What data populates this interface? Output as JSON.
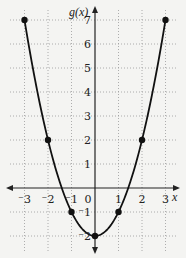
{
  "chart_data": {
    "type": "line",
    "title": "",
    "xlabel": "x",
    "ylabel": "g(x)",
    "xlim": [
      -3.5,
      3.5
    ],
    "ylim": [
      -2.5,
      7.5
    ],
    "grid": true,
    "grid_style": "dotted",
    "x_ticks": [
      -3,
      -2,
      -1,
      0,
      1,
      2,
      3
    ],
    "x_tick_labels": [
      "⁻3",
      "⁻2",
      "⁻1",
      "0",
      "1",
      "2",
      "3"
    ],
    "y_ticks": [
      -2,
      -1,
      1,
      2,
      3,
      4,
      5,
      6,
      7
    ],
    "y_tick_labels": [
      "⁻2",
      "⁻1",
      "1",
      "2",
      "3",
      "4",
      "5",
      "6",
      "7"
    ],
    "series": [
      {
        "name": "g(x)",
        "points": [
          {
            "x": -3,
            "y": 7
          },
          {
            "x": -2,
            "y": 2
          },
          {
            "x": -1,
            "y": -1
          },
          {
            "x": 0,
            "y": -2
          },
          {
            "x": 1,
            "y": -1
          },
          {
            "x": 2,
            "y": 2
          },
          {
            "x": 3,
            "y": 7
          }
        ],
        "curve": "parabola",
        "color": "#111111"
      }
    ],
    "legend": null
  },
  "colors": {
    "background": "#f4f4f2",
    "axis": "#222222",
    "grid": "#9a9a9a",
    "curve": "#111111"
  }
}
